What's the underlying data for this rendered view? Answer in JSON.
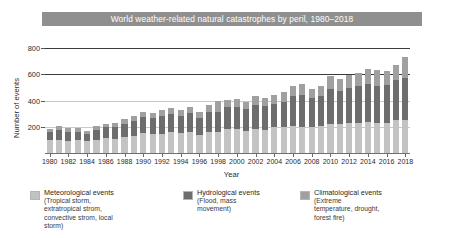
{
  "chart_data": {
    "type": "bar",
    "title": "World weather-related natural catastrophes by peril, 1980–2018",
    "xlabel": "Year",
    "ylabel": "Number of events",
    "ylim": [
      0,
      880
    ],
    "yticks": [
      200,
      400,
      600,
      800
    ],
    "grid": true,
    "stacked": true,
    "legend_position": "bottom",
    "x": [
      1980,
      1981,
      1982,
      1983,
      1984,
      1985,
      1986,
      1987,
      1988,
      1989,
      1990,
      1991,
      1992,
      1993,
      1994,
      1995,
      1996,
      1997,
      1998,
      1999,
      2000,
      2001,
      2002,
      2003,
      2004,
      2005,
      2006,
      2007,
      2008,
      2009,
      2010,
      2011,
      2012,
      2013,
      2014,
      2015,
      2016,
      2017,
      2018
    ],
    "xtick_labels": [
      "1980",
      "1982",
      "1984",
      "1986",
      "1988",
      "1990",
      "1992",
      "1994",
      "1996",
      "1998",
      "2000",
      "2002",
      "2004",
      "2006",
      "2008",
      "2010",
      "2012",
      "2014",
      "2016",
      "2018"
    ],
    "series": [
      {
        "name": "Meteorological events",
        "color": "#c3c3c3",
        "values": [
          105,
          110,
          100,
          105,
          95,
          105,
          120,
          115,
          130,
          140,
          165,
          160,
          160,
          170,
          165,
          175,
          150,
          175,
          170,
          200,
          195,
          185,
          195,
          190,
          215,
          215,
          225,
          215,
          215,
          220,
          240,
          235,
          245,
          250,
          255,
          250,
          250,
          270,
          275
        ]
      },
      {
        "name": "Hydrological events",
        "color": "#6d6d6d",
        "values": [
          70,
          80,
          75,
          70,
          60,
          85,
          90,
          95,
          110,
          120,
          130,
          130,
          145,
          150,
          140,
          155,
          140,
          160,
          165,
          180,
          185,
          175,
          200,
          195,
          190,
          205,
          240,
          260,
          235,
          245,
          290,
          275,
          290,
          300,
          315,
          300,
          310,
          330,
          340
        ]
      },
      {
        "name": "Climatological events",
        "color": "#a0a0a0",
        "values": [
          25,
          30,
          28,
          30,
          25,
          30,
          32,
          35,
          40,
          42,
          45,
          40,
          48,
          50,
          48,
          52,
          45,
          60,
          95,
          58,
          62,
          60,
          70,
          68,
          70,
          78,
          85,
          95,
          80,
          85,
          105,
          95,
          110,
          105,
          120,
          135,
          115,
          120,
          175
        ]
      }
    ],
    "legend": [
      {
        "label": "Meteorological events",
        "sub_lines": [
          "(Tropical storm, extratropical strom,",
          "convective strom, local storm)"
        ],
        "color": "#c3c3c3"
      },
      {
        "label": "Hydrological events",
        "sub_lines": [
          "(Flood, mass movement)"
        ],
        "color": "#6d6d6d"
      },
      {
        "label": "Climatological events",
        "sub_lines": [
          "(Extreme temperature, drought, forest fire)"
        ],
        "color": "#a0a0a0"
      }
    ]
  },
  "title_band": {
    "text": "World weather-related natural catastrophes by peril, 1980–2018",
    "background": "#8f8f8f",
    "text_color": "#ffffff"
  },
  "axes": {
    "y_label": "Number of events",
    "x_label": "Year",
    "y_tick_labels": [
      "800",
      "600",
      "400",
      "200"
    ]
  }
}
